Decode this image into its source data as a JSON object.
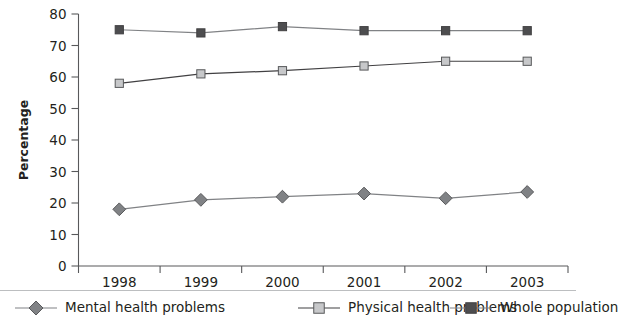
{
  "chart_data": {
    "type": "line",
    "title": "",
    "xlabel": "",
    "ylabel": "Percentage",
    "categories": [
      "1998",
      "1999",
      "2000",
      "2001",
      "2002",
      "2003"
    ],
    "ylim": [
      0,
      80
    ],
    "yticks": [
      0,
      10,
      20,
      30,
      40,
      50,
      60,
      70,
      80
    ],
    "grid": false,
    "legend_position": "bottom",
    "series": [
      {
        "name": "Mental health problems",
        "marker": "diamond",
        "marker_color": "#808285",
        "marker_edge_color": "#58595b",
        "line_color": "#808285",
        "values": [
          18,
          21,
          22,
          23,
          21.5,
          23.5
        ]
      },
      {
        "name": "Physical health problems",
        "marker": "square",
        "marker_color": "#c7c8ca",
        "marker_edge_color": "#58595b",
        "line_color": "#414042",
        "values": [
          58,
          61,
          62,
          63.5,
          65,
          65
        ]
      },
      {
        "name": "Whole population",
        "marker": "square",
        "marker_color": "#4d4d4f",
        "marker_edge_color": "#414042",
        "line_color": "#808285",
        "values": [
          75,
          74,
          76,
          74.7,
          74.7,
          74.7
        ]
      }
    ]
  },
  "axis": {
    "y_title": "Percentage"
  },
  "legend": {
    "items": [
      {
        "label": "Mental health problems"
      },
      {
        "label": "Physical health problems"
      },
      {
        "label": "Whole population"
      }
    ]
  }
}
